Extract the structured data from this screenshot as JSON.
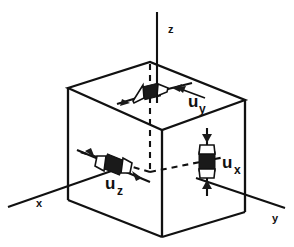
{
  "figure": {
    "type": "diagram",
    "background_color": "#ffffff",
    "line_color": "#111111",
    "marker_fill_color": "#1a1a1a"
  },
  "axes": [
    {
      "id": "x",
      "label": "x",
      "label_x": 36,
      "label_y": 207,
      "direction": "lower-left"
    },
    {
      "id": "y",
      "label": "y",
      "label_x": 272,
      "label_y": 222,
      "direction": "lower-right"
    },
    {
      "id": "z",
      "label": "z",
      "label_x": 168,
      "label_y": 33,
      "direction": "up"
    }
  ],
  "vectors": [
    {
      "id": "uy",
      "base": "u",
      "subscript": "y",
      "label_x": 188,
      "label_y": 107,
      "sub_x": 199,
      "sub_y": 113,
      "face": "top",
      "orientation": "horizontal",
      "arrow_sense": "inward-opposed"
    },
    {
      "id": "uz",
      "base": "u",
      "subscript": "z",
      "label_x": 105,
      "label_y": 189,
      "sub_x": 117,
      "sub_y": 195,
      "face": "left-front",
      "orientation": "diagonal",
      "arrow_sense": "inward-opposed"
    },
    {
      "id": "ux",
      "base": "u",
      "subscript": "x",
      "label_x": 222,
      "label_y": 168,
      "sub_x": 234,
      "sub_y": 174,
      "face": "right-front",
      "orientation": "vertical",
      "arrow_sense": "inward-opposed"
    }
  ],
  "cube": {
    "vertices": {
      "top_left": [
        68,
        88
      ],
      "top_back": [
        150,
        62
      ],
      "top_right": [
        245,
        100
      ],
      "top_front": [
        162,
        130
      ],
      "bottom_left": [
        68,
        200
      ],
      "bottom_front": [
        162,
        237
      ],
      "bottom_right": [
        245,
        212
      ],
      "hidden_back": [
        150,
        172
      ]
    },
    "hidden_edges": "dashed"
  }
}
